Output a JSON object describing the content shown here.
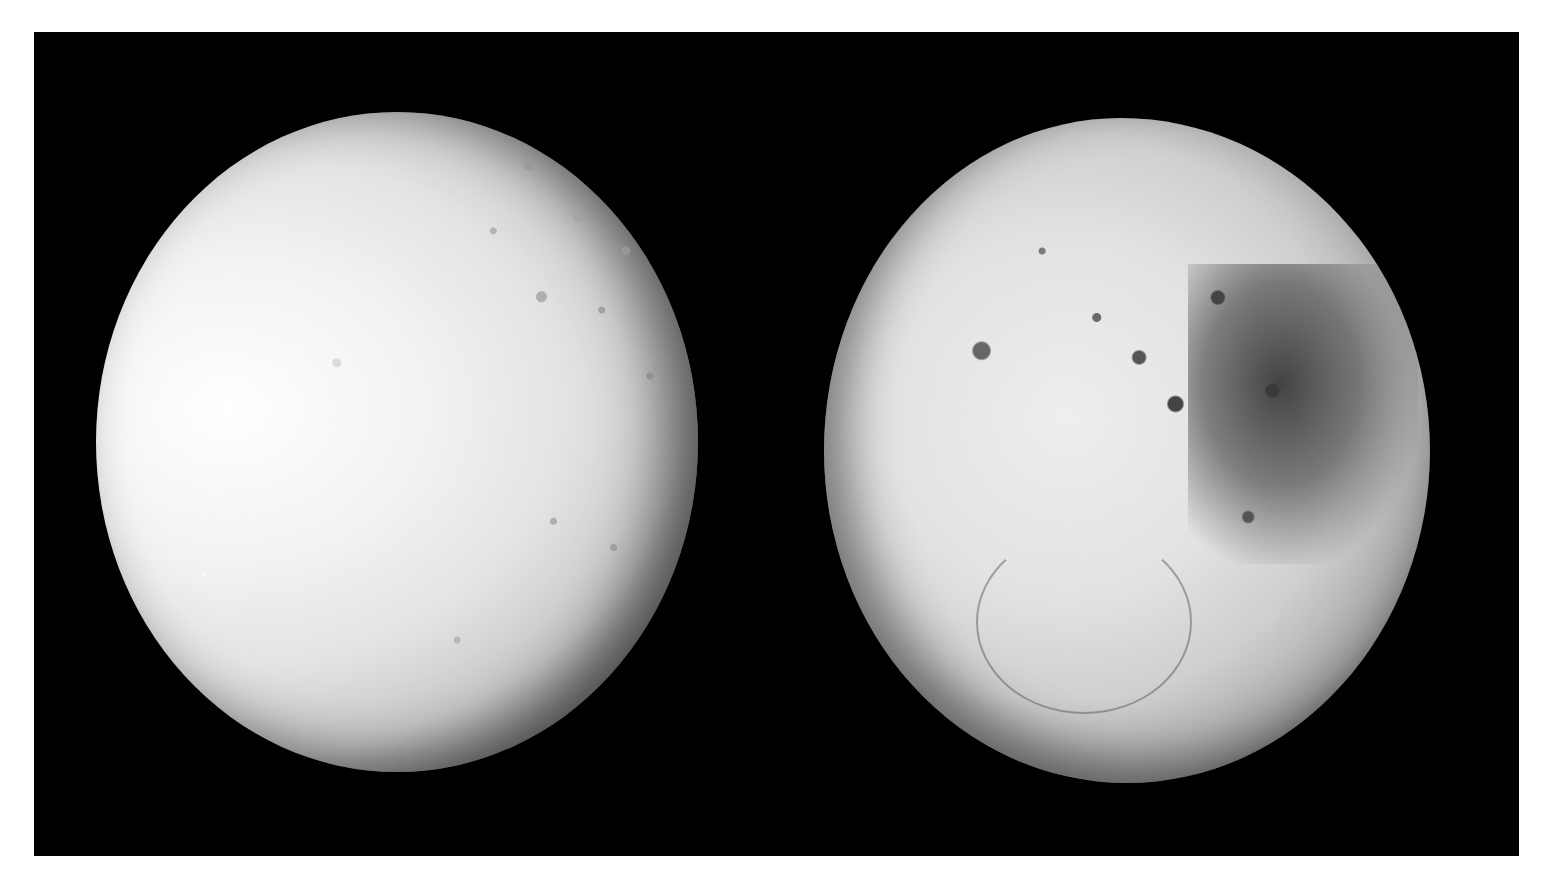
{
  "figure": {
    "panels": [
      {
        "name": "left-moon",
        "description": "bright icy moon with tectonic fractures and craters"
      },
      {
        "name": "right-moon",
        "description": "heavily cratered moon with dark and bright regions"
      }
    ],
    "colors": {
      "background": "#000000",
      "frame": "#ffffff"
    }
  }
}
